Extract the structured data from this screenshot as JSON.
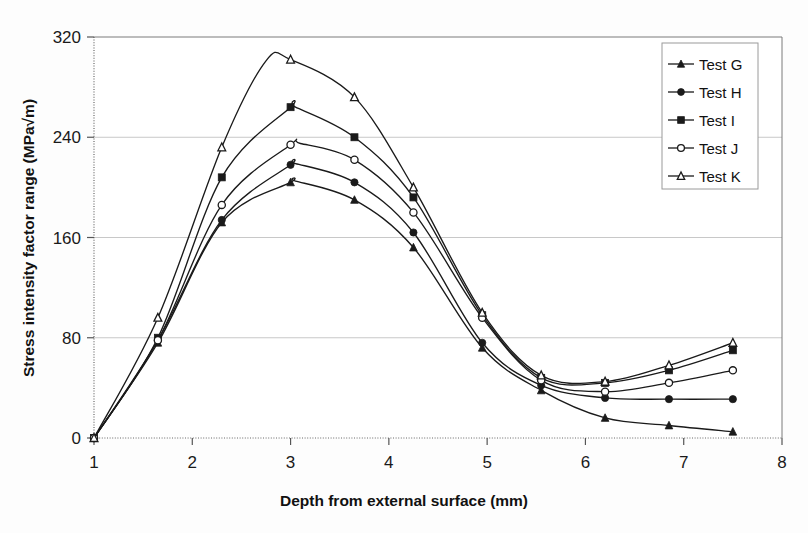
{
  "chart_data": {
    "type": "line",
    "title": "",
    "xlabel": "Depth from external surface (mm)",
    "ylabel": "Stress intensity factor range (MPa√m)",
    "xlim": [
      1,
      8
    ],
    "ylim": [
      0,
      320
    ],
    "xticks": [
      "1",
      "2",
      "3",
      "4",
      "5",
      "6",
      "7",
      "8"
    ],
    "xtick_values": [
      1,
      2,
      3,
      4,
      5,
      6,
      7,
      8
    ],
    "yticks": [
      "0",
      "80",
      "160",
      "240",
      "320"
    ],
    "ytick_values": [
      0,
      80,
      160,
      240,
      320
    ],
    "grid": "horizontal",
    "legend_position": "top-right",
    "x": [
      1.0,
      1.65,
      2.3,
      3.0,
      3.65,
      4.25,
      4.95,
      5.55,
      6.2,
      6.85,
      7.5
    ],
    "series": [
      {
        "name": "Test G",
        "marker": "filled-triangle",
        "values": [
          0,
          76,
          172,
          204,
          190,
          152,
          72,
          38,
          16,
          10,
          5
        ]
      },
      {
        "name": "Test H",
        "marker": "filled-circle",
        "values": [
          0,
          78,
          174,
          218,
          204,
          164,
          76,
          42,
          32,
          31,
          31
        ]
      },
      {
        "name": "Test I",
        "marker": "filled-square",
        "values": [
          0,
          80,
          208,
          264,
          240,
          192,
          98,
          48,
          44,
          54,
          70
        ]
      },
      {
        "name": "Test J",
        "marker": "open-circle",
        "values": [
          0,
          78,
          186,
          234,
          222,
          180,
          96,
          46,
          37,
          44,
          54
        ]
      },
      {
        "name": "Test K",
        "marker": "open-triangle",
        "values": [
          0,
          96,
          232,
          302,
          272,
          200,
          100,
          50,
          45,
          58,
          76
        ]
      }
    ],
    "peak_annotations": {
      "Test K": {
        "x": 2.75,
        "y": 301
      },
      "Test I": {
        "x": 3.05,
        "y": 264
      },
      "Test J": {
        "x": 3.1,
        "y": 235
      },
      "Test H": {
        "x": 3.05,
        "y": 219
      },
      "Test G": {
        "x": 3.05,
        "y": 205
      }
    }
  },
  "legend": {
    "items": [
      {
        "label": "Test G"
      },
      {
        "label": "Test H"
      },
      {
        "label": "Test I"
      },
      {
        "label": "Test J"
      },
      {
        "label": "Test K"
      }
    ]
  },
  "colors": {
    "line": "#1a1a1a",
    "grid": "#c8c8c8",
    "axis": "#555555",
    "text": "#111111",
    "background": "#fdfdfd",
    "legend_border": "#9a9a9a"
  }
}
